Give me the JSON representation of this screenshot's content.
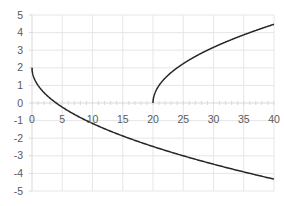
{
  "chart_data": {
    "type": "line",
    "title": "",
    "xlabel": "",
    "ylabel": "",
    "xlim": [
      0,
      40
    ],
    "ylim": [
      -5,
      5
    ],
    "x_ticks": [
      0,
      5,
      10,
      15,
      20,
      25,
      30,
      35,
      40
    ],
    "y_ticks": [
      5,
      4,
      3,
      2,
      1,
      0,
      -1,
      -2,
      -3,
      -4,
      -5
    ],
    "grid": true,
    "legend": null,
    "series": [
      {
        "name": "lower branch (y = 2 - sqrt(x))",
        "x": [
          0,
          1,
          2,
          4,
          6,
          9,
          12,
          16,
          20,
          25,
          30,
          35,
          40
        ],
        "y": [
          2.0,
          1.0,
          0.59,
          0.0,
          -0.45,
          -1.0,
          -1.46,
          -2.0,
          -2.47,
          -3.0,
          -3.48,
          -3.92,
          -4.32
        ]
      },
      {
        "name": "upper branch (y = sqrt(x - 20))",
        "x": [
          20,
          20.25,
          21,
          22,
          24,
          26,
          29,
          32,
          36,
          40
        ],
        "y": [
          0.0,
          0.5,
          1.0,
          1.41,
          2.0,
          2.45,
          3.0,
          3.46,
          4.0,
          4.47
        ]
      }
    ],
    "colors": {
      "line": "#262626",
      "grid": "#e6e6e6",
      "axis": "#d9d9d9",
      "tick_text": "#595959"
    }
  }
}
